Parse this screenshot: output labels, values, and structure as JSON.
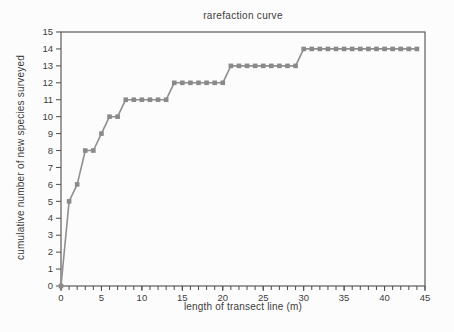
{
  "chart_data": {
    "type": "line",
    "title": "rarefaction curve",
    "xlabel": "length of transect line (m)",
    "ylabel": "cumulative number of new species surveyed",
    "xlim": [
      0,
      45
    ],
    "ylim": [
      0,
      15
    ],
    "x_major_tick_step": 5,
    "x_minor_tick_step": 1,
    "y_tick_step": 1,
    "x_tick_labels": [
      "0",
      "5",
      "10",
      "15",
      "20",
      "25",
      "30",
      "35",
      "40",
      "45"
    ],
    "y_tick_labels": [
      "0",
      "1",
      "2",
      "3",
      "4",
      "5",
      "6",
      "7",
      "8",
      "9",
      "10",
      "11",
      "12",
      "13",
      "14",
      "15"
    ],
    "grid": "off",
    "legend": "none",
    "marker": "square",
    "line_color": "#8f8f8f",
    "marker_color": "#8a8a8a",
    "axis_color": "#4d4d4d",
    "text_color": "#3c3c3c",
    "background": "#fcfcfc",
    "series": [
      {
        "name": "cumulative new species",
        "x": [
          0,
          1,
          2,
          3,
          4,
          5,
          6,
          7,
          8,
          9,
          10,
          11,
          12,
          13,
          14,
          15,
          16,
          17,
          18,
          19,
          20,
          21,
          22,
          23,
          24,
          25,
          26,
          27,
          28,
          29,
          30,
          31,
          32,
          33,
          34,
          35,
          36,
          37,
          38,
          39,
          40,
          41,
          42,
          43,
          44
        ],
        "y": [
          0,
          5,
          6,
          8,
          8,
          9,
          10,
          10,
          11,
          11,
          11,
          11,
          11,
          11,
          12,
          12,
          12,
          12,
          12,
          12,
          12,
          13,
          13,
          13,
          13,
          13,
          13,
          13,
          13,
          13,
          14,
          14,
          14,
          14,
          14,
          14,
          14,
          14,
          14,
          14,
          14,
          14,
          14,
          14,
          14
        ]
      }
    ]
  }
}
